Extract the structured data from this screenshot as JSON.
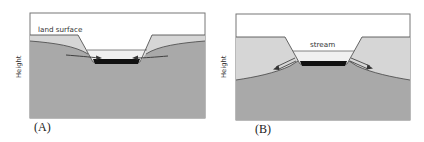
{
  "figure": {
    "panels": [
      {
        "id": "A",
        "label": "(A)",
        "y_axis_label": "Height",
        "annotation": "land surface",
        "flow_direction": "groundwater toward stream (gaining stream)"
      },
      {
        "id": "B",
        "label": "(B)",
        "y_axis_label": "Height",
        "annotation": "stream",
        "flow_direction": "stream water toward groundwater (losing stream)"
      }
    ],
    "colors": {
      "saturated_zone": "#a9a9a9",
      "unsaturated_zone": "#d6d6d6",
      "water": "#f0f0f0",
      "streambed": "#111111",
      "outline": "#555555",
      "sky": "#ffffff"
    }
  }
}
